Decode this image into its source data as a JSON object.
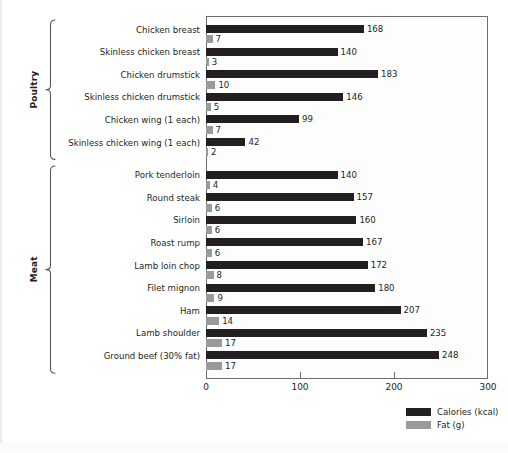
{
  "chart_data": {
    "type": "bar",
    "orientation": "horizontal",
    "title": "",
    "xlabel": "",
    "ylabel": "",
    "xlim": [
      0,
      300
    ],
    "xticks": [
      0,
      100,
      200,
      300
    ],
    "grid": false,
    "legend_position": "bottom-right",
    "categories": [
      "Chicken breast",
      "Skinless chicken breast",
      "Chicken drumstick",
      "Skinless chicken drumstick",
      "Chicken wing (1 each)",
      "Skinless chicken wing (1 each)",
      "Pork tenderloin",
      "Round steak",
      "Sirloin",
      "Roast rump",
      "Lamb loin chop",
      "Filet mignon",
      "Ham",
      "Lamb shoulder",
      "Ground beef (30% fat)"
    ],
    "series": [
      {
        "name": "Calories (kcal)",
        "color": "#231f20",
        "values": [
          168,
          140,
          183,
          146,
          99,
          42,
          140,
          157,
          160,
          167,
          172,
          180,
          207,
          235,
          248
        ]
      },
      {
        "name": "Fat (g)",
        "color": "#9a9a9a",
        "values": [
          7,
          3,
          10,
          5,
          7,
          2,
          4,
          6,
          6,
          6,
          8,
          9,
          14,
          17,
          17
        ]
      }
    ],
    "groups": [
      {
        "label": "Poultry",
        "start_index": 0,
        "end_index": 5
      },
      {
        "label": "Meat",
        "start_index": 6,
        "end_index": 14
      }
    ]
  },
  "legend": {
    "items": [
      {
        "label": "Calories (kcal)",
        "color": "#231f20"
      },
      {
        "label": "Fat (g)",
        "color": "#9a9a9a"
      }
    ]
  }
}
